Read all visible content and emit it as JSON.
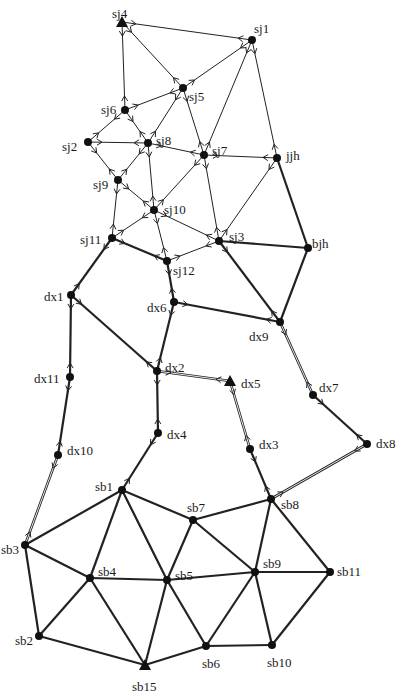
{
  "diagram": {
    "type": "network-graph",
    "nodes": [
      {
        "id": "sj4",
        "label": "sj4",
        "x": 122,
        "y": 22,
        "shape": "triangle",
        "lx": -10,
        "ly": -8
      },
      {
        "id": "sj1",
        "label": "sj1",
        "x": 252,
        "y": 40,
        "shape": "circle",
        "lx": 2,
        "ly": -11
      },
      {
        "id": "sj5",
        "label": "sj5",
        "x": 183,
        "y": 88,
        "shape": "circle",
        "lx": 6,
        "ly": 9
      },
      {
        "id": "sj6",
        "label": "sj6",
        "x": 125,
        "y": 110,
        "shape": "circle",
        "lx": -24,
        "ly": 0
      },
      {
        "id": "sj2",
        "label": "sj2",
        "x": 88,
        "y": 142,
        "shape": "circle",
        "lx": -26,
        "ly": 5
      },
      {
        "id": "sj8",
        "label": "sj8",
        "x": 148,
        "y": 143,
        "shape": "circle",
        "lx": 8,
        "ly": -2
      },
      {
        "id": "sj7",
        "label": "sj7",
        "x": 204,
        "y": 155,
        "shape": "circle",
        "lx": 8,
        "ly": -4
      },
      {
        "id": "jjh",
        "label": "jjh",
        "x": 277,
        "y": 158,
        "shape": "circle",
        "lx": 9,
        "ly": -2
      },
      {
        "id": "sj9",
        "label": "sj9",
        "x": 118,
        "y": 180,
        "shape": "circle",
        "lx": -25,
        "ly": 5
      },
      {
        "id": "sj10",
        "label": "sj10",
        "x": 154,
        "y": 210,
        "shape": "circle",
        "lx": 10,
        "ly": 0
      },
      {
        "id": "sj11",
        "label": "sj11",
        "x": 112,
        "y": 238,
        "shape": "circle",
        "lx": -32,
        "ly": 2
      },
      {
        "id": "sj3",
        "label": "sj3",
        "x": 219,
        "y": 241,
        "shape": "circle",
        "lx": 10,
        "ly": -4
      },
      {
        "id": "bjh",
        "label": "bjh",
        "x": 308,
        "y": 248,
        "shape": "circle",
        "lx": 4,
        "ly": -4
      },
      {
        "id": "sj12",
        "label": "sj12",
        "x": 167,
        "y": 261,
        "shape": "circle",
        "lx": 6,
        "ly": 10
      },
      {
        "id": "dx1",
        "label": "dx1",
        "x": 71,
        "y": 295,
        "shape": "circle",
        "lx": -27,
        "ly": 2
      },
      {
        "id": "dx6",
        "label": "dx6",
        "x": 174,
        "y": 302,
        "shape": "circle",
        "lx": -27,
        "ly": 6
      },
      {
        "id": "dx9",
        "label": "dx9",
        "x": 280,
        "y": 322,
        "shape": "circle",
        "lx": -31,
        "ly": 15
      },
      {
        "id": "dx2",
        "label": "dx2",
        "x": 157,
        "y": 371,
        "shape": "circle",
        "lx": 8,
        "ly": -3
      },
      {
        "id": "dx5",
        "label": "dx5",
        "x": 230,
        "y": 381,
        "shape": "triangle",
        "lx": 11,
        "ly": 3
      },
      {
        "id": "dx11",
        "label": "dx11",
        "x": 70,
        "y": 377,
        "shape": "circle",
        "lx": -36,
        "ly": 2
      },
      {
        "id": "dx7",
        "label": "dx7",
        "x": 313,
        "y": 395,
        "shape": "circle",
        "lx": 6,
        "ly": -7
      },
      {
        "id": "dx4",
        "label": "dx4",
        "x": 158,
        "y": 433,
        "shape": "circle",
        "lx": 9,
        "ly": 2
      },
      {
        "id": "dx10",
        "label": "dx10",
        "x": 58,
        "y": 455,
        "shape": "circle",
        "lx": 9,
        "ly": -4
      },
      {
        "id": "dx3",
        "label": "dx3",
        "x": 250,
        "y": 449,
        "shape": "circle",
        "lx": 9,
        "ly": -4
      },
      {
        "id": "dx8",
        "label": "dx8",
        "x": 367,
        "y": 444,
        "shape": "circle",
        "lx": 9,
        "ly": 0
      },
      {
        "id": "sb1",
        "label": "sb1",
        "x": 122,
        "y": 490,
        "shape": "circle",
        "lx": -27,
        "ly": -3
      },
      {
        "id": "sb8",
        "label": "sb8",
        "x": 271,
        "y": 499,
        "shape": "circle",
        "lx": 10,
        "ly": 6
      },
      {
        "id": "sb7",
        "label": "sb7",
        "x": 193,
        "y": 520,
        "shape": "circle",
        "lx": -6,
        "ly": -12
      },
      {
        "id": "sb3",
        "label": "sb3",
        "x": 25,
        "y": 545,
        "shape": "circle",
        "lx": -24,
        "ly": 5
      },
      {
        "id": "sb4",
        "label": "sb4",
        "x": 90,
        "y": 578,
        "shape": "circle",
        "lx": 8,
        "ly": -6
      },
      {
        "id": "sb5",
        "label": "sb5",
        "x": 167,
        "y": 580,
        "shape": "circle",
        "lx": 8,
        "ly": -4
      },
      {
        "id": "sb9",
        "label": "sb9",
        "x": 255,
        "y": 572,
        "shape": "circle",
        "lx": 8,
        "ly": -8
      },
      {
        "id": "sb11",
        "label": "sb11",
        "x": 330,
        "y": 572,
        "shape": "circle",
        "lx": 7,
        "ly": 0
      },
      {
        "id": "sb2",
        "label": "sb2",
        "x": 39,
        "y": 636,
        "shape": "circle",
        "lx": -24,
        "ly": 5
      },
      {
        "id": "sb6",
        "label": "sb6",
        "x": 206,
        "y": 646,
        "shape": "circle",
        "lx": -4,
        "ly": 18
      },
      {
        "id": "sb10",
        "label": "sb10",
        "x": 272,
        "y": 645,
        "shape": "circle",
        "lx": -5,
        "ly": 18
      },
      {
        "id": "sb15",
        "label": "sb15",
        "x": 145,
        "y": 665,
        "shape": "triangle",
        "lx": -13,
        "ly": 22
      }
    ],
    "edges": [
      {
        "from": "sj4",
        "to": "sj1",
        "style": "thin",
        "arrows": "both"
      },
      {
        "from": "sj4",
        "to": "sj6",
        "style": "thin",
        "arrows": "both"
      },
      {
        "from": "sj4",
        "to": "sj5",
        "style": "thin",
        "arrows": "both"
      },
      {
        "from": "sj1",
        "to": "sj5",
        "style": "thin",
        "arrows": "both"
      },
      {
        "from": "sj1",
        "to": "sj7",
        "style": "thin",
        "arrows": "both"
      },
      {
        "from": "sj1",
        "to": "jjh",
        "style": "thin",
        "arrows": "both"
      },
      {
        "from": "sj6",
        "to": "sj5",
        "style": "thin",
        "arrows": "both"
      },
      {
        "from": "sj6",
        "to": "sj2",
        "style": "thin",
        "arrows": "both"
      },
      {
        "from": "sj6",
        "to": "sj8",
        "style": "thin",
        "arrows": "both"
      },
      {
        "from": "sj5",
        "to": "sj8",
        "style": "thin",
        "arrows": "both"
      },
      {
        "from": "sj5",
        "to": "sj7",
        "style": "thin",
        "arrows": "both"
      },
      {
        "from": "sj2",
        "to": "sj8",
        "style": "thin",
        "arrows": "both"
      },
      {
        "from": "sj2",
        "to": "sj9",
        "style": "thin",
        "arrows": "both"
      },
      {
        "from": "sj8",
        "to": "sj7",
        "style": "thin",
        "arrows": "both"
      },
      {
        "from": "sj8",
        "to": "sj9",
        "style": "thin",
        "arrows": "both"
      },
      {
        "from": "sj8",
        "to": "sj10",
        "style": "thin",
        "arrows": "both"
      },
      {
        "from": "sj7",
        "to": "jjh",
        "style": "thin",
        "arrows": "both"
      },
      {
        "from": "sj7",
        "to": "sj10",
        "style": "thin",
        "arrows": "both"
      },
      {
        "from": "sj7",
        "to": "sj3",
        "style": "thin",
        "arrows": "both"
      },
      {
        "from": "jjh",
        "to": "sj3",
        "style": "thin",
        "arrows": "both"
      },
      {
        "from": "jjh",
        "to": "bjh",
        "style": "thick",
        "arrows": "none"
      },
      {
        "from": "sj9",
        "to": "sj10",
        "style": "thin",
        "arrows": "both"
      },
      {
        "from": "sj9",
        "to": "sj11",
        "style": "thin",
        "arrows": "both"
      },
      {
        "from": "sj10",
        "to": "sj11",
        "style": "thin",
        "arrows": "both"
      },
      {
        "from": "sj10",
        "to": "sj12",
        "style": "thin",
        "arrows": "both"
      },
      {
        "from": "sj10",
        "to": "sj3",
        "style": "thin",
        "arrows": "both"
      },
      {
        "from": "sj11",
        "to": "sj12",
        "style": "thick",
        "arrows": "both"
      },
      {
        "from": "sj11",
        "to": "dx1",
        "style": "thick",
        "arrows": "both"
      },
      {
        "from": "sj12",
        "to": "sj3",
        "style": "thin",
        "arrows": "both"
      },
      {
        "from": "sj12",
        "to": "dx6",
        "style": "thick",
        "arrows": "both"
      },
      {
        "from": "sj3",
        "to": "bjh",
        "style": "thick",
        "arrows": "none"
      },
      {
        "from": "sj3",
        "to": "dx9",
        "style": "thick",
        "arrows": "both"
      },
      {
        "from": "bjh",
        "to": "dx9",
        "style": "thick",
        "arrows": "none"
      },
      {
        "from": "dx1",
        "to": "dx11",
        "style": "thick",
        "arrows": "both"
      },
      {
        "from": "dx1",
        "to": "dx2",
        "style": "thick",
        "arrows": "both"
      },
      {
        "from": "dx6",
        "to": "dx9",
        "style": "thick",
        "arrows": "both"
      },
      {
        "from": "dx6",
        "to": "dx2",
        "style": "thick",
        "arrows": "both"
      },
      {
        "from": "dx9",
        "to": "dx7",
        "style": "double",
        "arrows": "both"
      },
      {
        "from": "dx2",
        "to": "dx5",
        "style": "double",
        "arrows": "both"
      },
      {
        "from": "dx2",
        "to": "dx4",
        "style": "thick",
        "arrows": "both"
      },
      {
        "from": "dx11",
        "to": "dx10",
        "style": "thick",
        "arrows": "both"
      },
      {
        "from": "dx5",
        "to": "dx3",
        "style": "double",
        "arrows": "both"
      },
      {
        "from": "dx7",
        "to": "dx8",
        "style": "thick",
        "arrows": "both"
      },
      {
        "from": "dx4",
        "to": "sb1",
        "style": "thick",
        "arrows": "both"
      },
      {
        "from": "dx10",
        "to": "sb3",
        "style": "double",
        "arrows": "both"
      },
      {
        "from": "dx3",
        "to": "sb8",
        "style": "thick",
        "arrows": "both"
      },
      {
        "from": "dx8",
        "to": "sb8",
        "style": "double",
        "arrows": "both"
      },
      {
        "from": "sb1",
        "to": "sb3",
        "style": "thick",
        "arrows": "none"
      },
      {
        "from": "sb1",
        "to": "sb4",
        "style": "thick",
        "arrows": "none"
      },
      {
        "from": "sb1",
        "to": "sb5",
        "style": "thick",
        "arrows": "none"
      },
      {
        "from": "sb1",
        "to": "sb7",
        "style": "thick",
        "arrows": "none"
      },
      {
        "from": "sb8",
        "to": "sb7",
        "style": "thick",
        "arrows": "none"
      },
      {
        "from": "sb8",
        "to": "sb9",
        "style": "thick",
        "arrows": "none"
      },
      {
        "from": "sb8",
        "to": "sb11",
        "style": "thick",
        "arrows": "none"
      },
      {
        "from": "sb7",
        "to": "sb5",
        "style": "thick",
        "arrows": "none"
      },
      {
        "from": "sb7",
        "to": "sb9",
        "style": "thick",
        "arrows": "none"
      },
      {
        "from": "sb3",
        "to": "sb4",
        "style": "thick",
        "arrows": "none"
      },
      {
        "from": "sb3",
        "to": "sb2",
        "style": "thick",
        "arrows": "none"
      },
      {
        "from": "sb4",
        "to": "sb5",
        "style": "thick",
        "arrows": "none"
      },
      {
        "from": "sb4",
        "to": "sb2",
        "style": "thick",
        "arrows": "none"
      },
      {
        "from": "sb4",
        "to": "sb15",
        "style": "thick",
        "arrows": "none"
      },
      {
        "from": "sb5",
        "to": "sb9",
        "style": "thick",
        "arrows": "none"
      },
      {
        "from": "sb5",
        "to": "sb15",
        "style": "thick",
        "arrows": "none"
      },
      {
        "from": "sb5",
        "to": "sb6",
        "style": "thick",
        "arrows": "none"
      },
      {
        "from": "sb9",
        "to": "sb11",
        "style": "thick",
        "arrows": "none"
      },
      {
        "from": "sb9",
        "to": "sb6",
        "style": "thick",
        "arrows": "none"
      },
      {
        "from": "sb9",
        "to": "sb10",
        "style": "thick",
        "arrows": "none"
      },
      {
        "from": "sb11",
        "to": "sb10",
        "style": "thick",
        "arrows": "none"
      },
      {
        "from": "sb6",
        "to": "sb10",
        "style": "thick",
        "arrows": "none"
      },
      {
        "from": "sb6",
        "to": "sb15",
        "style": "thick",
        "arrows": "none"
      },
      {
        "from": "sb2",
        "to": "sb15",
        "style": "thick",
        "arrows": "none"
      }
    ]
  }
}
